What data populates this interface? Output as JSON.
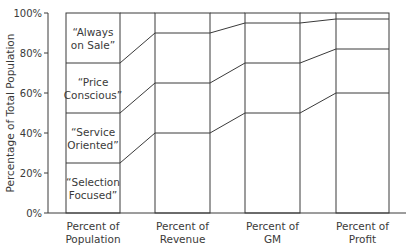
{
  "chart_data": {
    "type": "bar",
    "subtype": "stacked-100-percent-with-connectors",
    "title": "",
    "xlabel": "",
    "ylabel": "Percentage of Total Population",
    "ylim": [
      0,
      100
    ],
    "yticks": [
      "0%",
      "20%",
      "40%",
      "60%",
      "80%",
      "100%"
    ],
    "grid": false,
    "legend": "inline labels in first bar",
    "categories": [
      "Percent of Population",
      "Percent of Revenue",
      "Percent of GM",
      "Percent of Profit"
    ],
    "category_lines": [
      [
        "Percent of",
        "Population"
      ],
      [
        "Percent of",
        "Revenue"
      ],
      [
        "Percent of",
        "GM"
      ],
      [
        "Percent of",
        "Profit"
      ]
    ],
    "series": [
      {
        "name": "“Selection Focused”",
        "label_lines": [
          "“Selection",
          "Focused”"
        ],
        "values": [
          25,
          40,
          50,
          60
        ]
      },
      {
        "name": "“Service Oriented”",
        "label_lines": [
          "“Service",
          "Oriented”"
        ],
        "values": [
          25,
          25,
          25,
          22
        ]
      },
      {
        "name": "“Price Conscious”",
        "label_lines": [
          "“Price",
          "Conscious”"
        ],
        "values": [
          25,
          25,
          20,
          15
        ]
      },
      {
        "name": "“Always on Sale”",
        "label_lines": [
          "“Always",
          "on Sale”"
        ],
        "values": [
          25,
          10,
          5,
          3
        ]
      }
    ],
    "cumulative_boundaries": [
      [
        25,
        50,
        75
      ],
      [
        40,
        65,
        90
      ],
      [
        50,
        75,
        95
      ],
      [
        60,
        82,
        97
      ]
    ]
  },
  "colors": {
    "line": "#3a3a3a",
    "background": "#ffffff"
  }
}
